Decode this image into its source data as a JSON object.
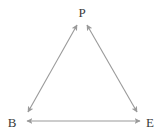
{
  "diagram": {
    "background_color": "#ffffff",
    "stroke_color": "#9a9a9a",
    "label_color": "#3a3a3a",
    "stroke_width": 1.1,
    "nodes": [
      {
        "id": "P",
        "label": "P",
        "x": 82,
        "y": 12
      },
      {
        "id": "B",
        "label": "B",
        "x": 12,
        "y": 122
      },
      {
        "id": "E",
        "label": "E",
        "x": 150,
        "y": 122
      }
    ],
    "edges": [
      {
        "id": "edge-b-p",
        "from": "B",
        "to": "P",
        "arrows": "both",
        "x1": 28,
        "y1": 112,
        "x2": 77,
        "y2": 25
      },
      {
        "id": "edge-p-e",
        "from": "P",
        "to": "E",
        "arrows": "both",
        "x1": 87,
        "y1": 25,
        "x2": 137,
        "y2": 112
      },
      {
        "id": "edge-b-e",
        "from": "B",
        "to": "E",
        "arrows": "both",
        "x1": 27,
        "y1": 121,
        "x2": 140,
        "y2": 121
      }
    ]
  }
}
